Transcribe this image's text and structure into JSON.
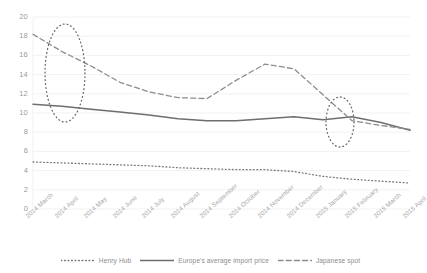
{
  "chart_data": {
    "type": "line",
    "title": "",
    "xlabel": "",
    "ylabel": "",
    "ylim": [
      0,
      20
    ],
    "ytick_step": 2,
    "grid": true,
    "legend_position": "bottom",
    "yticks": [
      "20",
      "18",
      "16",
      "14",
      "12",
      "10",
      "8",
      "6",
      "4",
      "2",
      "0"
    ],
    "categories": [
      "2014 March",
      "2014 April",
      "2014 May",
      "2014 June",
      "2014 July",
      "2014 August",
      "2014 September",
      "2014 October",
      "2014 November",
      "2014 December",
      "2015 January",
      "2015 February",
      "2015 March",
      "2015 April"
    ],
    "series": [
      {
        "name": "Henry Hub",
        "style": "dotted",
        "color": "#7a7a7a",
        "values": [
          4.9,
          4.8,
          4.7,
          4.6,
          4.5,
          4.3,
          4.2,
          4.1,
          4.1,
          3.9,
          3.4,
          3.1,
          2.9,
          2.7
        ]
      },
      {
        "name": "Europe's average import price",
        "style": "solid",
        "color": "#6e6e6e",
        "values": [
          10.9,
          10.7,
          10.4,
          10.1,
          9.8,
          9.4,
          9.2,
          9.2,
          9.4,
          9.6,
          9.3,
          9.6,
          9.0,
          8.2
        ]
      },
      {
        "name": "Japanese spot",
        "style": "dashed",
        "color": "#8c8c8c",
        "values": [
          18.2,
          16.4,
          14.9,
          13.2,
          12.2,
          11.6,
          11.5,
          13.4,
          15.1,
          14.6,
          11.9,
          9.2,
          8.7,
          8.3
        ]
      }
    ],
    "annotations": [
      {
        "name": "ellipse-april-2014",
        "shape": "ellipse",
        "style": "dotted",
        "color": "#6b6b6b"
      },
      {
        "name": "ellipse-february-2015",
        "shape": "ellipse",
        "style": "dotted",
        "color": "#6b6b6b"
      }
    ]
  },
  "legend": {
    "items": [
      {
        "label": "Henry Hub"
      },
      {
        "label": "Europe's average import price"
      },
      {
        "label": "Japanese spot"
      }
    ]
  }
}
